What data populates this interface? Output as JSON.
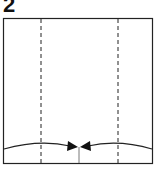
{
  "diagram": {
    "step_number": "2",
    "colors": {
      "line": "#222222",
      "background": "#ffffff"
    }
  }
}
